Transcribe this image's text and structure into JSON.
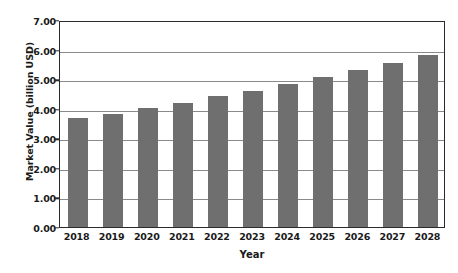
{
  "chart_data": {
    "type": "bar",
    "title": "",
    "xlabel": "Year",
    "ylabel": "Market Value (billion USD)",
    "categories": [
      "2018",
      "2019",
      "2020",
      "2021",
      "2022",
      "2023",
      "2024",
      "2025",
      "2026",
      "2027",
      "2028"
    ],
    "values": [
      3.67,
      3.83,
      4.03,
      4.21,
      4.42,
      4.61,
      4.84,
      5.06,
      5.3,
      5.56,
      5.82
    ],
    "ylim": [
      0.0,
      7.0
    ],
    "y_ticks": [
      "0.00",
      "1.00",
      "2.00",
      "3.00",
      "4.00",
      "5.00",
      "6.00",
      "7.00"
    ],
    "y_tick_values": [
      0,
      1,
      2,
      3,
      4,
      5,
      6,
      7
    ],
    "grid": "horizontal",
    "legend": "none",
    "bar_color": "#706F6F",
    "grid_color": "#8A8A8A",
    "axis_color": "#2B2B2B",
    "background_color": "#FFFFFF",
    "text_color": "#1A1A1A"
  }
}
